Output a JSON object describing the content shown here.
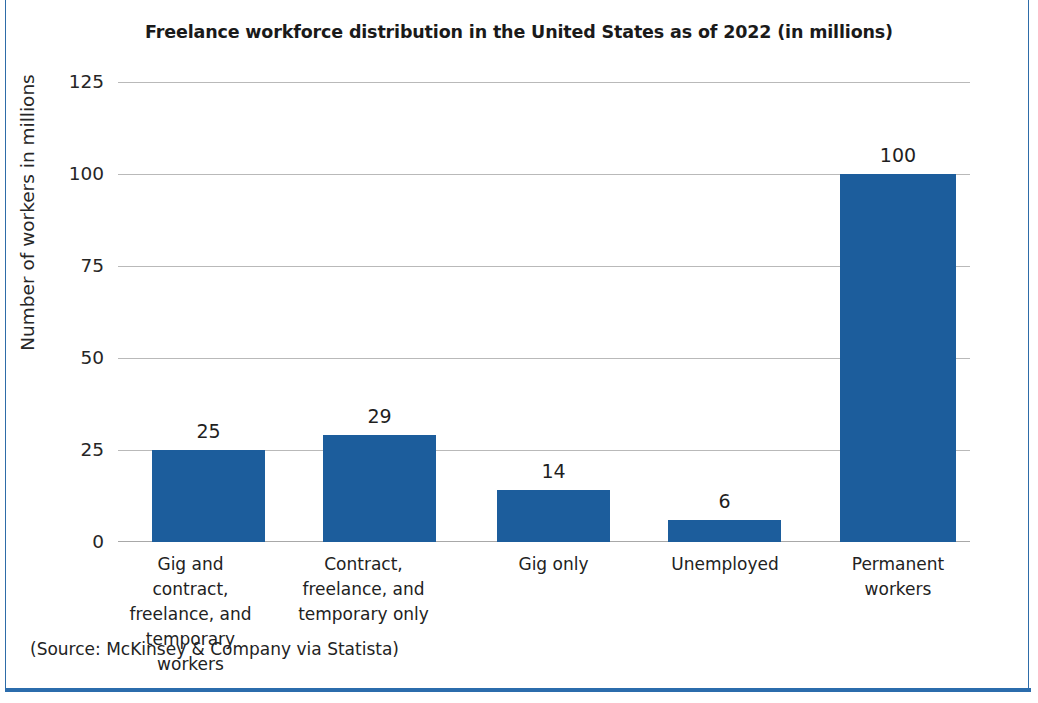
{
  "frame": {
    "border_color": "#2e6ca8"
  },
  "source_note": "(Source: McKinsey & Company via Statista)",
  "chart_data": {
    "type": "bar",
    "title": "Freelance workforce distribution in the United States as of 2022 (in millions)",
    "xlabel": "",
    "ylabel": "Number of workers in millions",
    "ylim": [
      0,
      125
    ],
    "yticks": [
      0,
      25,
      50,
      75,
      100,
      125
    ],
    "ytick_labels": [
      "0",
      "25",
      "50",
      "75",
      "100",
      "125"
    ],
    "grid": true,
    "legend": false,
    "bar_color": "#1c5d9c",
    "categories": [
      "Gig and contract, freelance, and temporary workers",
      "Contract, freelance, and temporary only",
      "Gig only",
      "Unemployed",
      "Permanent workers"
    ],
    "category_lines": [
      [
        "Gig and contract,",
        "freelance, and",
        "temporary workers"
      ],
      [
        "Contract,",
        "freelance, and",
        "temporary only"
      ],
      [
        "Gig only"
      ],
      [
        "Unemployed"
      ],
      [
        "Permanent",
        "workers"
      ]
    ],
    "values": [
      25,
      29,
      14,
      6,
      100
    ],
    "value_labels": [
      "25",
      "29",
      "14",
      "6",
      "100"
    ],
    "units": "millions"
  }
}
